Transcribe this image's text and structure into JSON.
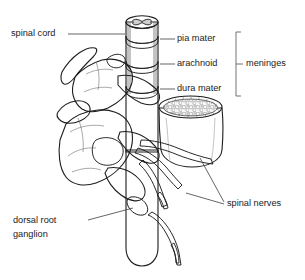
{
  "figure": {
    "kind": "anatomical-diagram",
    "background_color": "#ffffff",
    "ink_color": "#1d1d1d",
    "leader_color": "#4a4a4a",
    "cord_fill": "#8d8d8d",
    "bone_fill": "#e3e3e3",
    "nerve_fill": "#9a9a9a",
    "marrow_fill": "#f2f2f2"
  },
  "labels": {
    "spinal_cord": "spinal cord",
    "pia_mater": "pia mater",
    "arachnoid": "arachnoid",
    "dura_mater": "dura mater",
    "meninges": "meninges",
    "spinal_nerves": "spinal nerves",
    "dorsal_root_line1": "dorsal root",
    "dorsal_root_line2": "ganglion"
  },
  "structures": {
    "spinal_cord": "spinal cord",
    "vertebra_upper": "upper vertebra",
    "vertebra_lower": "lower vertebra",
    "vertebral_body": "cut vertebral body with spongy bone",
    "spinous_process_upper": "upper spinous process",
    "spinous_process_lower": "lower spinous process",
    "transverse_process": "transverse process",
    "gray_matter": "butterfly gray matter cross-section",
    "pia_band": "pia mater band",
    "arachnoid_band": "arachnoid band",
    "dura_band": "dura mater band",
    "nerve_roots": "spinal nerve roots",
    "ganglion_swelling": "dorsal root ganglion swelling"
  }
}
